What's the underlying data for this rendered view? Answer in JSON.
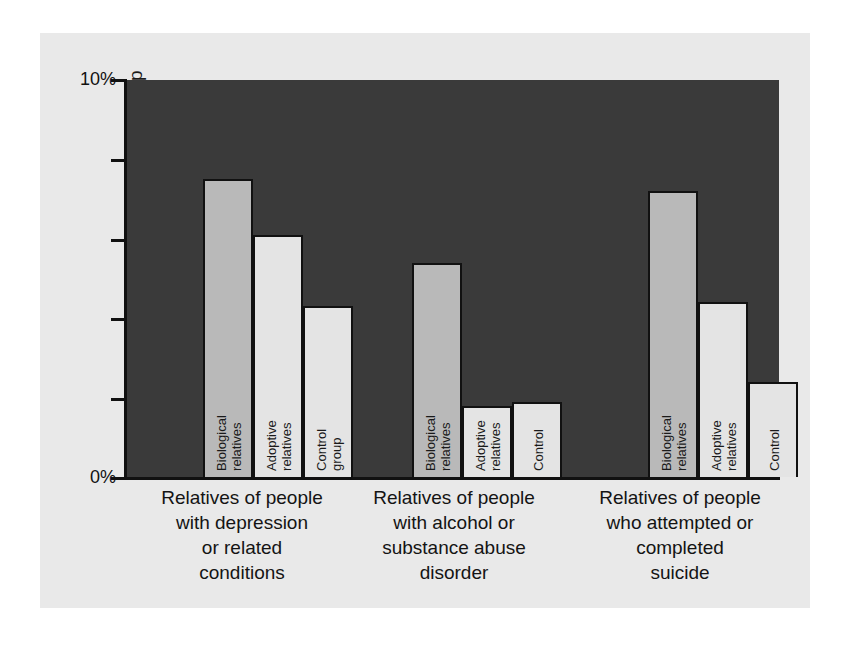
{
  "figure": {
    "background_color": "#e9e9e9",
    "plot_background_color": "#3a3a3a",
    "axis_color": "#111111"
  },
  "axis": {
    "y_title": "Percent of people who will develop\nthe condition themselves",
    "y_ticks": [
      "10%",
      "",
      "",
      "",
      "",
      "0%"
    ],
    "y_tick_top_label": "10%",
    "y_tick_bottom_label": "0%"
  },
  "series_colors": {
    "biological": "#b9b9b9",
    "adoptive": "#e4e4e4",
    "control": "#e4e4e4"
  },
  "chart_data": {
    "type": "bar",
    "title": "",
    "xlabel": "",
    "ylabel": "Percent of people who will develop the condition themselves",
    "ylim": [
      0,
      10
    ],
    "y_unit": "%",
    "grid": false,
    "legend": "in-bar labels",
    "categories": [
      "Relatives of people\nwith depression\nor related\nconditions",
      "Relatives of people\nwith alcohol or\nsubstance abuse\ndisorder",
      "Relatives of people\nwho attempted or\ncompleted\nsuicide"
    ],
    "series": [
      {
        "name": "Biological relatives",
        "values": [
          7.5,
          5.4,
          7.2
        ]
      },
      {
        "name": "Adoptive relatives",
        "values": [
          6.1,
          1.8,
          4.4
        ]
      },
      {
        "name": "Control group",
        "values": [
          4.3,
          1.9,
          2.4
        ]
      }
    ],
    "bars": [
      {
        "group": 0,
        "bars": [
          {
            "label": "Biological relatives",
            "value": 7.5,
            "series": "biological"
          },
          {
            "label": "Adoptive relatives",
            "value": 6.1,
            "series": "adoptive"
          },
          {
            "label": "Control group",
            "value": 4.3,
            "series": "control"
          }
        ]
      },
      {
        "group": 1,
        "bars": [
          {
            "label": "Biological relatives",
            "value": 5.4,
            "series": "biological"
          },
          {
            "label": "Adoptive\nrelatives",
            "value": 1.8,
            "series": "adoptive"
          },
          {
            "label": "Control",
            "value": 1.9,
            "series": "control"
          }
        ]
      },
      {
        "group": 2,
        "bars": [
          {
            "label": "Biological relatives",
            "value": 7.2,
            "series": "biological"
          },
          {
            "label": "Adoptive relatives",
            "value": 4.4,
            "series": "adoptive"
          },
          {
            "label": "Control",
            "value": 2.4,
            "series": "control"
          }
        ]
      }
    ]
  }
}
